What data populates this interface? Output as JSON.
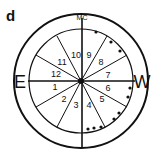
{
  "panel_label": "d",
  "top_label": "MC",
  "left_label": "E",
  "right_label": "W",
  "houses": [
    {
      "num": "1",
      "x": 55,
      "y": 90
    },
    {
      "num": "2",
      "x": 64,
      "y": 102
    },
    {
      "num": "3",
      "x": 76,
      "y": 108
    },
    {
      "num": "4",
      "x": 89,
      "y": 108
    },
    {
      "num": "5",
      "x": 102,
      "y": 102
    },
    {
      "num": "6",
      "x": 108,
      "y": 91
    },
    {
      "num": "7",
      "x": 108,
      "y": 78
    },
    {
      "num": "8",
      "x": 101,
      "y": 65
    },
    {
      "num": "9",
      "x": 89,
      "y": 58
    },
    {
      "num": "10",
      "x": 76,
      "y": 58
    },
    {
      "num": "11",
      "x": 62,
      "y": 65
    },
    {
      "num": "12",
      "x": 56,
      "y": 77
    }
  ],
  "dots": [
    {
      "x": 96,
      "y": 32
    },
    {
      "x": 111,
      "y": 42
    },
    {
      "x": 120,
      "y": 51
    },
    {
      "x": 130,
      "y": 88
    },
    {
      "x": 128,
      "y": 97
    },
    {
      "x": 119,
      "y": 113
    },
    {
      "x": 114,
      "y": 119
    },
    {
      "x": 88,
      "y": 129
    },
    {
      "x": 94,
      "y": 128
    },
    {
      "x": 101,
      "y": 127
    }
  ],
  "colors": {
    "stroke": "#111111",
    "background": "#ffffff"
  }
}
